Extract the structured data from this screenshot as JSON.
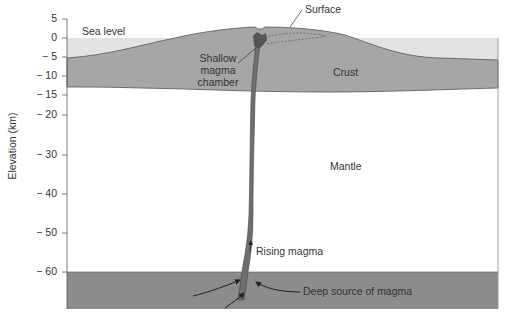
{
  "diagram": {
    "y_axis": {
      "label": "Elevation (km)",
      "ticks": [
        "5",
        "0",
        "− 5",
        "− 10",
        "− 15",
        "− 20",
        "− 30",
        "− 40",
        "− 50",
        "− 60"
      ]
    },
    "labels": {
      "sea_level": "Sea level",
      "surface": "Surface",
      "shallow_chamber_1": "Shallow",
      "shallow_chamber_2": "magma",
      "shallow_chamber_3": "chamber",
      "crust": "Crust",
      "mantle": "Mantle",
      "rising_magma": "Rising magma",
      "deep_source": "Deep source of magma"
    },
    "colors": {
      "sea": "#e3e3e3",
      "crust": "#a6a6a6",
      "mantle": "#ffffff",
      "deep_source": "#8c8c8c",
      "magma": "#6f6f6f",
      "line": "#444444"
    }
  }
}
